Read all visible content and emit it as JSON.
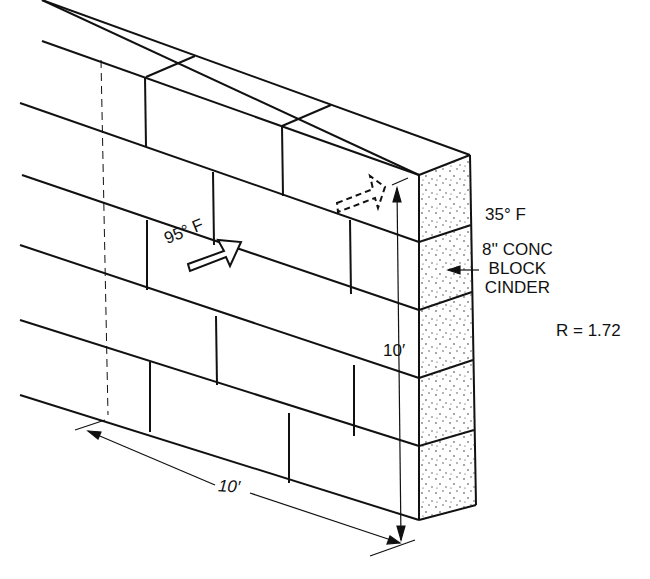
{
  "diagram": {
    "inside_temperature": "95° F",
    "outside_temperature": "35° F",
    "material": {
      "line1": "8'' CONC",
      "line2": "BLOCK",
      "line3": "CINDER"
    },
    "r_value_label": "R = 1.72",
    "dimensions": {
      "height": "10′",
      "length": "10′"
    },
    "courses": 5,
    "colors": {
      "line": "#111111",
      "background": "#ffffff",
      "stipple": "#333333"
    }
  }
}
